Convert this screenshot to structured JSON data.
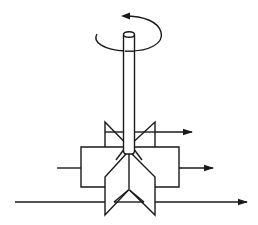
{
  "diagram": {
    "type": "mechanical-schematic",
    "background": "#ffffff",
    "stroke_color": "#1a1a1a",
    "components": [
      {
        "name": "rotation-arrow",
        "description": "curved arrow around top of shaft indicating counter-clockwise rotation"
      },
      {
        "name": "shaft",
        "description": "vertical cylindrical shaft"
      },
      {
        "name": "upper-vanes",
        "description": "two triangular vanes above housing"
      },
      {
        "name": "housing",
        "description": "rectangular housing box"
      },
      {
        "name": "lower-vanes",
        "description": "two angled vanes below shaft tip with triangular joint"
      },
      {
        "name": "inlet-left",
        "description": "short line entering housing from left"
      },
      {
        "name": "outlet-upper",
        "description": "arrow exiting right from upper vane"
      },
      {
        "name": "outlet-middle",
        "description": "arrow exiting right from housing"
      },
      {
        "name": "through-flow",
        "description": "long horizontal arrow passing under housing left to right"
      }
    ]
  }
}
